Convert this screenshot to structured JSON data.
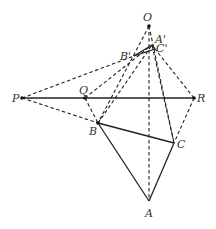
{
  "diagram": {
    "points": {
      "O": {
        "label": "O",
        "x": 149,
        "y": 26
      },
      "A_prime": {
        "label": "A'",
        "x": 152,
        "y": 45
      },
      "C_prime": {
        "label": "C'",
        "x": 155,
        "y": 49
      },
      "B_prime": {
        "label": "B'",
        "x": 134,
        "y": 56
      },
      "P": {
        "label": "P",
        "x": 22,
        "y": 98
      },
      "Q": {
        "label": "Q",
        "x": 85,
        "y": 98
      },
      "R": {
        "label": "R",
        "x": 194,
        "y": 98
      },
      "B": {
        "label": "B",
        "x": 98,
        "y": 123
      },
      "C": {
        "label": "C",
        "x": 174,
        "y": 143
      },
      "A": {
        "label": "A",
        "x": 149,
        "y": 201
      }
    },
    "solid_segments": [
      [
        "A",
        "B"
      ],
      [
        "B",
        "C"
      ],
      [
        "A",
        "C"
      ],
      [
        "A_prime",
        "B_prime"
      ],
      [
        "B_prime",
        "C_prime"
      ],
      [
        "A_prime",
        "C_prime"
      ],
      [
        "P",
        "R"
      ]
    ],
    "dashed_segments": [
      [
        "O",
        "A"
      ],
      [
        "O",
        "B"
      ],
      [
        "O",
        "C"
      ],
      [
        "P",
        "B_prime"
      ],
      [
        "P",
        "B"
      ],
      [
        "Q",
        "B"
      ],
      [
        "Q",
        "A_prime"
      ],
      [
        "R",
        "C"
      ],
      [
        "R",
        "C_prime"
      ],
      [
        "B",
        "A_prime"
      ],
      [
        "C",
        "A_prime"
      ]
    ]
  }
}
